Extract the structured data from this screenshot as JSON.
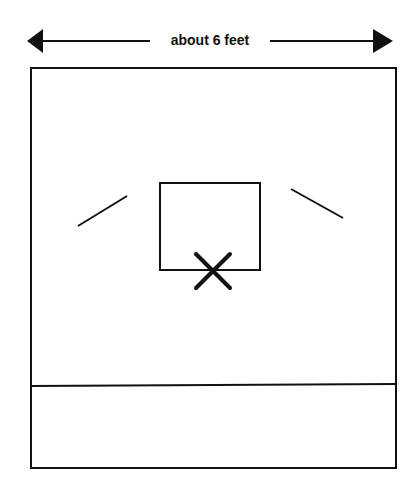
{
  "diagram": {
    "dimension_label": "about 6 feet",
    "colors": {
      "stroke": "#111111",
      "background": "#ffffff"
    }
  }
}
